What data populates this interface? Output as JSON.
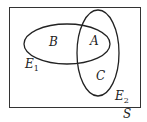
{
  "diagram": {
    "type": "venn",
    "universe_label": "S",
    "sets": [
      {
        "name": "E1",
        "label_main": "E",
        "label_sub": "1"
      },
      {
        "name": "E2",
        "label_main": "E",
        "label_sub": "2"
      }
    ],
    "regions": [
      {
        "label": "B",
        "membership": "E1 only"
      },
      {
        "label": "A",
        "membership": "E1 and E2"
      },
      {
        "label": "C",
        "membership": "E2 only"
      }
    ],
    "colors": {
      "stroke": "#222222",
      "background": "#ffffff"
    }
  }
}
